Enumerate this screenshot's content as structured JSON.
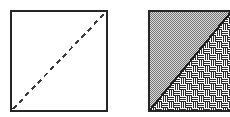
{
  "figure": {
    "title": "Square with diagonal — plain and hatched versions",
    "background_color": "#ffffff",
    "width": 230,
    "height": 117,
    "panel_count": 2
  },
  "panels": [
    {
      "id": "left-panel",
      "name": "plain-square-with-dashed-diagonal",
      "label": "",
      "x": 10,
      "y": 10,
      "width": 98,
      "height": 102,
      "fill": "#ffffff",
      "border_color": "#262626",
      "border_width": 2,
      "diagonal": {
        "style": "dashed",
        "from": "bottom-left",
        "to": "top-right",
        "color": "#3a3a3a",
        "width": 2,
        "dash_pattern": "5 4"
      }
    },
    {
      "id": "right-panel",
      "name": "hatched-square-with-solid-diagonal",
      "label": "",
      "x": 148,
      "y": 11,
      "width": 84,
      "height": 101,
      "border_color": "#262626",
      "border_width": 2,
      "cropped_at_right_edge": true,
      "diagonal": {
        "style": "solid",
        "from": "bottom-left",
        "to": "top-right",
        "color": "#1f1f1f",
        "width": 2
      },
      "regions": [
        {
          "name": "upper-left-triangle",
          "fill_type": "stipple-checkerboard",
          "fill_color": "#808080",
          "background_color": "#d9d9d9",
          "cell_size": 2
        },
        {
          "name": "lower-right-triangle",
          "fill_type": "basketweave",
          "line_color": "#2b2b2b",
          "background_color": "#ffffff",
          "tile_size": 12,
          "line_count_per_block": 3
        }
      ]
    }
  ],
  "colors": {
    "ink": "#262626",
    "stipple_gray": "#808080",
    "stipple_base": "#d9d9d9",
    "paper": "#ffffff"
  }
}
